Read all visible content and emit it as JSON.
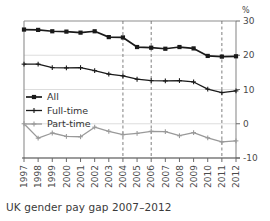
{
  "caption": "UK gender pay gap 2007–2012",
  "axis": {
    "unit_label": "%",
    "y_ticks": [
      "30",
      "20",
      "10",
      "0",
      "-10"
    ],
    "y_values": [
      30,
      20,
      10,
      0,
      -10
    ]
  },
  "legend": {
    "items": [
      {
        "label": "All",
        "color": "#1a1a1a",
        "marker": "square"
      },
      {
        "label": "Full-time",
        "color": "#1a1a1a",
        "marker": "plus"
      },
      {
        "label": "Part-time",
        "color": "#9a9a9a",
        "marker": "plus"
      }
    ]
  },
  "chart_data": {
    "type": "line",
    "title": "UK gender pay gap 2007–2012",
    "xlabel": "",
    "ylabel": "%",
    "ylim": [
      -10,
      30
    ],
    "grid": true,
    "legend_position": "inside-left",
    "categories": [
      "1997",
      "1998",
      "1999",
      "2000",
      "2001",
      "2002",
      "2003",
      "2004",
      "2005",
      "2006",
      "2007",
      "2008",
      "2009",
      "2010",
      "2011",
      "2012"
    ],
    "annotations": [
      {
        "type": "vline",
        "x": "2004",
        "style": "dashed"
      },
      {
        "type": "vline",
        "x": "2006",
        "style": "dashed"
      },
      {
        "type": "vline",
        "x": "2011",
        "style": "dashed"
      }
    ],
    "series": [
      {
        "name": "All",
        "color": "#1a1a1a",
        "marker": "square",
        "values": [
          27.5,
          27.4,
          27.0,
          26.9,
          26.6,
          27.0,
          25.3,
          25.2,
          22.4,
          22.2,
          21.9,
          22.4,
          22.0,
          19.8,
          19.6,
          19.7
        ]
      },
      {
        "name": "Full-time",
        "color": "#1a1a1a",
        "marker": "plus",
        "values": [
          17.4,
          17.4,
          16.4,
          16.3,
          16.4,
          15.5,
          14.5,
          14.0,
          13.0,
          12.6,
          12.5,
          12.6,
          12.2,
          10.1,
          9.1,
          9.6
        ]
      },
      {
        "name": "Part-time",
        "color": "#9a9a9a",
        "marker": "plus",
        "values": [
          0.0,
          -4.2,
          -2.7,
          -3.7,
          -3.8,
          -1.0,
          -2.2,
          -3.2,
          -2.8,
          -2.2,
          -2.3,
          -3.5,
          -2.6,
          -4.1,
          -5.3,
          -5.0
        ]
      }
    ]
  }
}
